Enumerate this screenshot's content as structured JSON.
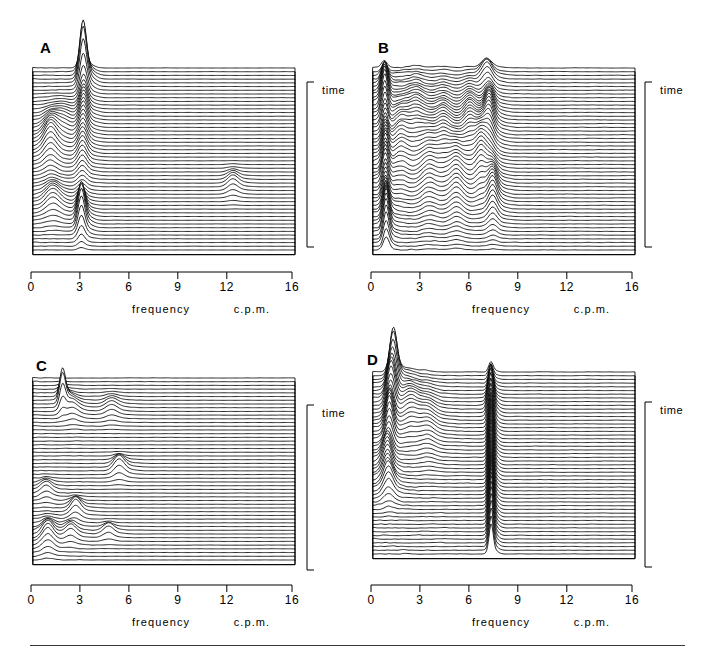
{
  "figure": {
    "width": 716,
    "height": 652,
    "background": "#ffffff",
    "ink": "#000000",
    "rule": {
      "x": 30,
      "y": 645,
      "width": 655,
      "height": 1,
      "color": "#3a3a3a"
    }
  },
  "axis": {
    "tick_values": [
      0,
      3,
      6,
      9,
      12,
      16
    ],
    "tick_labels": [
      "0",
      "3",
      "6",
      "9",
      "12",
      "16"
    ],
    "xlabel": "frequency",
    "unit_label": "c.p.m.",
    "xlim": [
      0,
      16
    ],
    "time_label": "time",
    "time_axis_direction": "downward"
  },
  "chart_data": {
    "type": "line",
    "subtype": "waterfall-ridgeline-spectrogram",
    "title": "",
    "xlabel": "frequency",
    "xunit": "c.p.m.",
    "ylabel": "time",
    "xlim": [
      0,
      16
    ],
    "xticks": [
      0,
      3,
      6,
      9,
      12,
      16
    ],
    "grid": false,
    "legend": null,
    "traces_per_panel": 50,
    "panels": [
      {
        "id": "A",
        "label": "A",
        "n_traces": 50,
        "description": "Dominant sharp spectral peak near 3 c.p.m. persisting through the record, with a very tall spike in the upper (early) traces and a second tall spike in the lower (late) traces; low-frequency activity near 1 c.p.m. in the middle; an isolated small peak near 12 c.p.m. in the lower-middle section.",
        "peaks": [
          {
            "freq": 3.05,
            "amp": 1.0,
            "width": 0.2,
            "t_center": 0.06,
            "t_spread": 0.05
          },
          {
            "freq": 3.1,
            "amp": 0.34,
            "width": 0.22,
            "t_center": 0.22,
            "t_spread": 0.12
          },
          {
            "freq": 3.0,
            "amp": 0.3,
            "width": 0.26,
            "t_center": 0.46,
            "t_spread": 0.14
          },
          {
            "freq": 2.95,
            "amp": 0.7,
            "width": 0.2,
            "t_center": 0.84,
            "t_spread": 0.07
          },
          {
            "freq": 1.05,
            "amp": 0.36,
            "width": 0.36,
            "t_center": 0.42,
            "t_spread": 0.1
          },
          {
            "freq": 1.2,
            "amp": 0.26,
            "width": 0.4,
            "t_center": 0.74,
            "t_spread": 0.07
          },
          {
            "freq": 1.8,
            "amp": 0.14,
            "width": 0.45,
            "t_center": 0.3,
            "t_spread": 0.08
          },
          {
            "freq": 12.2,
            "amp": 0.16,
            "width": 0.3,
            "t_center": 0.64,
            "t_spread": 0.05
          }
        ],
        "noise_amp": 0.03
      },
      {
        "id": "B",
        "label": "B",
        "n_traces": 50,
        "description": "Broadband irregular activity spread from 0 to about 8 c.p.m. with many overlapping peaks; a persistent sharp low-frequency peak near 0.7 c.p.m., a strong band near 6.5-7.5 c.p.m. in the middle of the record, and near-flat traces above 9 c.p.m.",
        "peaks": [
          {
            "freq": 0.7,
            "amp": 0.62,
            "width": 0.18,
            "t_center": 0.18,
            "t_spread": 0.1
          },
          {
            "freq": 0.75,
            "amp": 0.52,
            "width": 0.18,
            "t_center": 0.55,
            "t_spread": 0.18
          },
          {
            "freq": 0.8,
            "amp": 0.58,
            "width": 0.17,
            "t_center": 0.88,
            "t_spread": 0.09
          },
          {
            "freq": 1.7,
            "amp": 0.3,
            "width": 0.38,
            "t_center": 0.42,
            "t_spread": 0.18
          },
          {
            "freq": 2.6,
            "amp": 0.26,
            "width": 0.4,
            "t_center": 0.3,
            "t_spread": 0.16
          },
          {
            "freq": 3.4,
            "amp": 0.28,
            "width": 0.4,
            "t_center": 0.55,
            "t_spread": 0.2
          },
          {
            "freq": 4.3,
            "amp": 0.3,
            "width": 0.38,
            "t_center": 0.4,
            "t_spread": 0.18
          },
          {
            "freq": 5.1,
            "amp": 0.32,
            "width": 0.36,
            "t_center": 0.62,
            "t_spread": 0.18
          },
          {
            "freq": 5.9,
            "amp": 0.34,
            "width": 0.34,
            "t_center": 0.35,
            "t_spread": 0.16
          },
          {
            "freq": 6.6,
            "amp": 0.4,
            "width": 0.3,
            "t_center": 0.52,
            "t_spread": 0.14
          },
          {
            "freq": 7.1,
            "amp": 0.46,
            "width": 0.26,
            "t_center": 0.3,
            "t_spread": 0.12
          },
          {
            "freq": 7.3,
            "amp": 0.4,
            "width": 0.26,
            "t_center": 0.72,
            "t_spread": 0.12
          },
          {
            "freq": 6.9,
            "amp": 0.28,
            "width": 0.3,
            "t_center": 0.05,
            "t_spread": 0.05
          }
        ],
        "noise_amp": 0.075
      },
      {
        "id": "C",
        "label": "C",
        "n_traces": 50,
        "description": "Mostly quiescent flat traces with low-amplitude noise; a tall narrow peak near 1.8 c.p.m. in the upper traces, a modest peak near 5.2 c.p.m. in the middle, and scattered low-frequency peaks near 1-3 c.p.m. in the lowest (latest) traces.",
        "peaks": [
          {
            "freq": 1.8,
            "amp": 0.62,
            "width": 0.17,
            "t_center": 0.13,
            "t_spread": 0.04
          },
          {
            "freq": 2.4,
            "amp": 0.16,
            "width": 0.35,
            "t_center": 0.18,
            "t_spread": 0.05
          },
          {
            "freq": 4.8,
            "amp": 0.14,
            "width": 0.35,
            "t_center": 0.17,
            "t_spread": 0.05
          },
          {
            "freq": 5.25,
            "amp": 0.24,
            "width": 0.3,
            "t_center": 0.5,
            "t_spread": 0.04
          },
          {
            "freq": 0.8,
            "amp": 0.16,
            "width": 0.3,
            "t_center": 0.62,
            "t_spread": 0.04
          },
          {
            "freq": 2.6,
            "amp": 0.24,
            "width": 0.28,
            "t_center": 0.73,
            "t_spread": 0.04
          },
          {
            "freq": 0.9,
            "amp": 0.28,
            "width": 0.32,
            "t_center": 0.88,
            "t_spread": 0.06
          },
          {
            "freq": 2.3,
            "amp": 0.18,
            "width": 0.3,
            "t_center": 0.86,
            "t_spread": 0.04
          },
          {
            "freq": 4.6,
            "amp": 0.16,
            "width": 0.3,
            "t_center": 0.85,
            "t_spread": 0.03
          }
        ],
        "noise_amp": 0.035
      },
      {
        "id": "D",
        "label": "D",
        "n_traces": 50,
        "description": "Very strong low-frequency activity near 1-1.5 c.p.m. in the upper (early) traces with tall ragged peaks, plus an intense, extremely persistent narrow peak at about 7.2 c.p.m. that dominates the middle and lower two-thirds of the record; traces above 9 c.p.m. are flat.",
        "peaks": [
          {
            "freq": 1.25,
            "amp": 0.92,
            "width": 0.22,
            "t_center": 0.04,
            "t_spread": 0.05
          },
          {
            "freq": 1.1,
            "amp": 0.7,
            "width": 0.24,
            "t_center": 0.16,
            "t_spread": 0.06
          },
          {
            "freq": 1.0,
            "amp": 0.66,
            "width": 0.22,
            "t_center": 0.32,
            "t_spread": 0.07
          },
          {
            "freq": 0.85,
            "amp": 0.44,
            "width": 0.26,
            "t_center": 0.5,
            "t_spread": 0.07
          },
          {
            "freq": 0.95,
            "amp": 0.34,
            "width": 0.28,
            "t_center": 0.64,
            "t_spread": 0.06
          },
          {
            "freq": 2.3,
            "amp": 0.26,
            "width": 0.4,
            "t_center": 0.22,
            "t_spread": 0.12
          },
          {
            "freq": 3.3,
            "amp": 0.18,
            "width": 0.42,
            "t_center": 0.3,
            "t_spread": 0.14
          },
          {
            "freq": 7.2,
            "amp": 0.9,
            "width": 0.13,
            "t_center": 0.52,
            "t_spread": 0.3
          },
          {
            "freq": 7.22,
            "amp": 0.55,
            "width": 0.12,
            "t_center": 0.88,
            "t_spread": 0.12
          },
          {
            "freq": 7.15,
            "amp": 0.35,
            "width": 0.16,
            "t_center": 0.2,
            "t_spread": 0.06
          }
        ],
        "noise_amp": 0.06
      }
    ]
  },
  "layout": {
    "panels": [
      {
        "id": "A",
        "plot_x": 33,
        "plot_y": 68,
        "plot_w": 262,
        "plot_h": 182,
        "letter_x": 40,
        "letter_y": 40,
        "bracket_x": 307,
        "bracket_y0": 82,
        "bracket_y1": 247,
        "time_x": 322,
        "time_y": 85,
        "axis_y": 272,
        "axis_x0": 31,
        "axis_x1": 292,
        "ticklabel_y": 281,
        "caption_y": 304,
        "freq_caption_x": 161,
        "unit_caption_x": 252
      },
      {
        "id": "B",
        "plot_x": 373,
        "plot_y": 68,
        "plot_w": 262,
        "plot_h": 182,
        "letter_x": 378,
        "letter_y": 40,
        "bracket_x": 645,
        "bracket_y0": 82,
        "bracket_y1": 247,
        "time_x": 660,
        "time_y": 85,
        "axis_y": 272,
        "axis_x0": 371,
        "axis_x1": 632,
        "ticklabel_y": 281,
        "caption_y": 304,
        "freq_caption_x": 501,
        "unit_caption_x": 592
      },
      {
        "id": "C",
        "plot_x": 33,
        "plot_y": 378,
        "plot_w": 262,
        "plot_h": 182,
        "letter_x": 36,
        "letter_y": 358,
        "bracket_x": 307,
        "bracket_y0": 405,
        "bracket_y1": 570,
        "time_x": 322,
        "time_y": 408,
        "axis_y": 585,
        "axis_x0": 31,
        "axis_x1": 292,
        "ticklabel_y": 594,
        "caption_y": 617,
        "freq_caption_x": 161,
        "unit_caption_x": 252
      },
      {
        "id": "D",
        "plot_x": 373,
        "plot_y": 372,
        "plot_w": 262,
        "plot_h": 182,
        "letter_x": 367,
        "letter_y": 352,
        "bracket_x": 645,
        "bracket_y0": 402,
        "bracket_y1": 567,
        "time_x": 660,
        "time_y": 405,
        "axis_y": 585,
        "axis_x0": 371,
        "axis_x1": 632,
        "ticklabel_y": 594,
        "caption_y": 617,
        "freq_caption_x": 501,
        "unit_caption_x": 592
      }
    ]
  }
}
